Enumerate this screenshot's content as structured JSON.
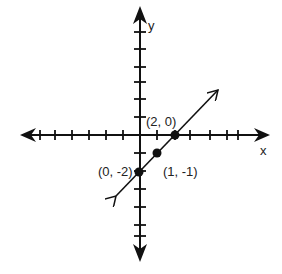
{
  "diagram": {
    "type": "coordinate-plane",
    "axes": {
      "x_label": "x",
      "y_label": "y"
    },
    "points": [
      {
        "label": "(2, 0)",
        "x": 2,
        "y": 0
      },
      {
        "label": "(1, -1)",
        "x": 1,
        "y": -1
      },
      {
        "label": "(0, -2)",
        "x": 0,
        "y": -2
      }
    ],
    "line": {
      "equation": "y = x - 2",
      "arrows": "both"
    },
    "colors": {
      "ink": "#111111",
      "background": "#ffffff"
    }
  }
}
